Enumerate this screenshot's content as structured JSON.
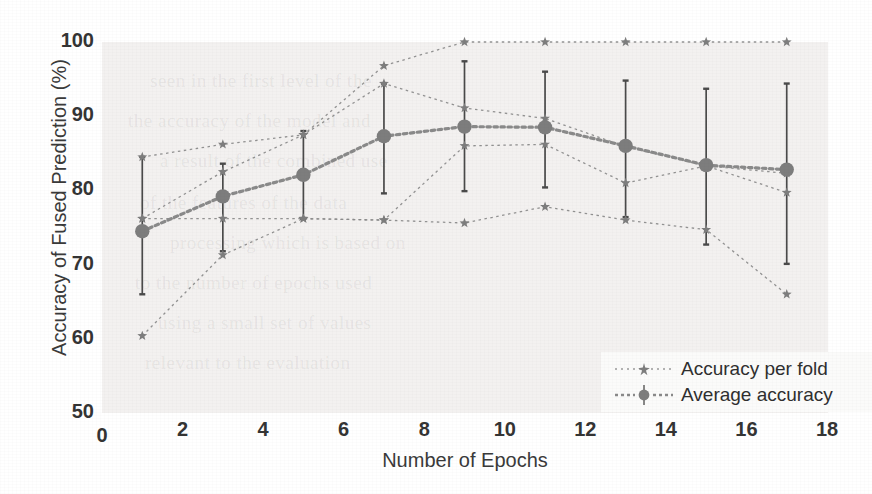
{
  "chart_data": {
    "type": "line",
    "title": "",
    "xlabel": "Number of Epochs",
    "ylabel": "Accuracy of Fused Prediction (%)",
    "xlim": [
      0,
      18
    ],
    "ylim": [
      50,
      100
    ],
    "xticks": [
      0,
      2,
      4,
      6,
      8,
      10,
      12,
      14,
      16,
      18
    ],
    "yticks": [
      50,
      60,
      70,
      80,
      90,
      100
    ],
    "grid": false,
    "legend_position": "lower right",
    "x": [
      1,
      3,
      5,
      7,
      9,
      11,
      13,
      15,
      17
    ],
    "series": [
      {
        "name": "Accuracy per fold",
        "marker": "star",
        "linestyle": "dotted",
        "folds": [
          {
            "fold": 1,
            "values": [
              84.5,
              86.2,
              87.5,
              96.8,
              100.0,
              100.0,
              100.0,
              100.0,
              100.0
            ]
          },
          {
            "fold": 2,
            "values": [
              76.2,
              82.5,
              87.5,
              94.4,
              91.1,
              89.7,
              85.9,
              83.3,
              82.3
            ]
          },
          {
            "fold": 3,
            "values": [
              76.2,
              76.2,
              76.2,
              76.0,
              86.0,
              86.2,
              81.0,
              83.3,
              79.7
            ]
          },
          {
            "fold": 4,
            "values": [
              60.4,
              71.3,
              76.2,
              76.0,
              75.6,
              77.8,
              76.0,
              74.7,
              66.0
            ]
          }
        ]
      },
      {
        "name": "Average accuracy",
        "marker": "filled-circle",
        "linestyle": "dotted",
        "values": [
          74.5,
          79.2,
          82.1,
          87.3,
          88.6,
          88.5,
          86.0,
          83.4,
          82.8
        ],
        "error_low": [
          66.0,
          71.8,
          76.2,
          79.6,
          79.9,
          80.4,
          76.4,
          72.7,
          70.1
        ],
        "error_high": [
          84.5,
          83.6,
          88.0,
          94.4,
          97.4,
          96.0,
          94.8,
          93.7,
          94.4
        ]
      }
    ]
  },
  "legend": {
    "items": [
      {
        "label": "Accuracy per fold",
        "symbol": "star-marker-dotted-line"
      },
      {
        "label": "Average accuracy",
        "symbol": "circle-marker-errorbar-dotted-line"
      }
    ]
  },
  "colors": {
    "marker": "#7d7d7d",
    "line": "#8a8a8a",
    "errorbar": "#4a4a4a",
    "axis_text": "#343434",
    "plot_background": "#ebe9e7"
  },
  "ghost_text": {
    "lines": [
      "seen in the first level of the",
      "the accuracy of the model and",
      "a result of the combined use",
      "of the features of the data",
      "processing which is based on",
      "to the number of epochs used",
      "using a small set of values",
      "relevant to the evaluation"
    ]
  }
}
